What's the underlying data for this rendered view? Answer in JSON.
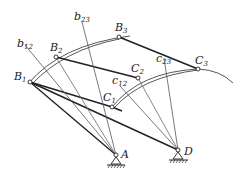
{
  "diagram": {
    "title": "",
    "points": {
      "B1": {
        "label": "B",
        "sub": "1",
        "x": 30,
        "y": 82
      },
      "B2": {
        "label": "B",
        "sub": "2",
        "x": 56,
        "y": 57
      },
      "B3": {
        "label": "B",
        "sub": "3",
        "x": 119,
        "y": 37
      },
      "C1": {
        "label": "C",
        "sub": "1",
        "x": 112,
        "y": 107
      },
      "C2": {
        "label": "C",
        "sub": "2",
        "x": 138,
        "y": 78
      },
      "C3": {
        "label": "C",
        "sub": "3",
        "x": 198,
        "y": 69
      },
      "A": {
        "label": "A",
        "x": 116,
        "y": 155
      },
      "D": {
        "label": "D",
        "x": 178,
        "y": 150
      }
    },
    "bisector_labels": {
      "b12": {
        "label": "b",
        "sub": "12"
      },
      "b23": {
        "label": "b",
        "sub": "23"
      },
      "c12": {
        "label": "c",
        "sub": "12"
      },
      "c23": {
        "label": "c",
        "sub": "23"
      }
    },
    "colors": {
      "line": "#333333",
      "thin": "#555555",
      "bg": "#ffffff"
    }
  }
}
